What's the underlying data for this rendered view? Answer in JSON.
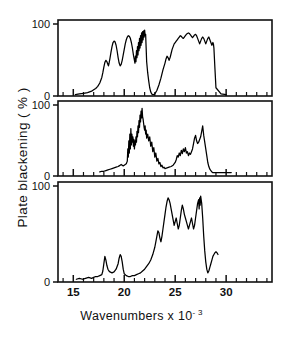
{
  "figure": {
    "top_cutoff_text": "",
    "ylabel": "Plate blackening ( % )",
    "xlabel_main": "Wavenumbers x 10",
    "xlabel_exponent": "- 3",
    "panel_ytick_top": "100",
    "panel_ytick_bottom": "0"
  },
  "chart_data": {
    "type": "line",
    "title": "",
    "xlabel": "Wavenumbers x 10^-3",
    "ylabel": "Plate blackening ( % )",
    "xlim": [
      13.5,
      34.5
    ],
    "ylim": [
      0,
      105
    ],
    "xticks": [
      15,
      20,
      25,
      30
    ],
    "xtick_labels": [
      "15",
      "20",
      "25",
      "30"
    ],
    "xtick_minor_step": 1,
    "yticks": [
      0,
      100
    ],
    "ytick_labels": [
      "0",
      "100"
    ],
    "grid": false,
    "legend": "none",
    "n_panels": 3,
    "panels": [
      {
        "name": "panel-top",
        "index": 0,
        "x": [
          15.2,
          15.6,
          16.0,
          16.4,
          16.8,
          17.0,
          17.2,
          17.4,
          17.6,
          17.8,
          17.9,
          18.0,
          18.1,
          18.2,
          18.3,
          18.4,
          18.45,
          18.5,
          18.6,
          18.7,
          18.8,
          18.9,
          19.0,
          19.1,
          19.2,
          19.3,
          19.4,
          19.5,
          19.6,
          19.7,
          19.8,
          19.9,
          20.0,
          20.1,
          20.2,
          20.3,
          20.4,
          20.5,
          20.6,
          20.7,
          20.8,
          20.9,
          21.0,
          21.05,
          21.1,
          21.15,
          21.2,
          21.25,
          21.3,
          21.35,
          21.4,
          21.45,
          21.5,
          21.55,
          21.6,
          21.65,
          21.7,
          21.75,
          21.8,
          21.85,
          21.9,
          21.95,
          22.0,
          22.05,
          22.1,
          22.15,
          22.2,
          22.3,
          22.4,
          22.5,
          22.6,
          22.7,
          22.8,
          22.9,
          23.0,
          23.2,
          23.4,
          23.6,
          23.8,
          24.0,
          24.1,
          24.2,
          24.3,
          24.4,
          24.5,
          24.6,
          24.7,
          24.8,
          24.9,
          25.0,
          25.1,
          25.2,
          25.3,
          25.4,
          25.5,
          25.6,
          25.7,
          25.8,
          25.9,
          26.0,
          26.1,
          26.2,
          26.3,
          26.4,
          26.5,
          26.6,
          26.7,
          26.8,
          26.9,
          27.0,
          27.1,
          27.2,
          27.3,
          27.4,
          27.5,
          27.6,
          27.7,
          27.8,
          27.9,
          28.0,
          28.1,
          28.2,
          28.3,
          28.4,
          28.5,
          28.6,
          28.7,
          28.75,
          28.8,
          28.9,
          29.0,
          29.5,
          30.0
        ],
        "y": [
          2,
          3,
          4,
          5,
          7,
          9,
          11,
          14,
          19,
          27,
          34,
          42,
          49,
          52,
          50,
          46,
          44,
          47,
          55,
          64,
          72,
          78,
          80,
          79,
          74,
          66,
          56,
          48,
          44,
          46,
          52,
          60,
          68,
          76,
          82,
          86,
          88,
          87,
          84,
          78,
          70,
          60,
          52,
          48,
          58,
          50,
          66,
          56,
          72,
          60,
          78,
          66,
          84,
          70,
          88,
          74,
          92,
          78,
          94,
          82,
          95,
          86,
          96,
          88,
          90,
          70,
          50,
          34,
          22,
          12,
          6,
          3,
          2,
          2,
          3,
          8,
          16,
          26,
          38,
          48,
          54,
          58,
          56,
          52,
          56,
          62,
          68,
          72,
          76,
          78,
          80,
          82,
          84,
          86,
          88,
          87,
          85,
          84,
          86,
          88,
          90,
          91,
          92,
          91,
          89,
          87,
          85,
          87,
          89,
          90,
          88,
          84,
          80,
          76,
          80,
          84,
          86,
          84,
          80,
          76,
          80,
          84,
          86,
          82,
          78,
          74,
          78,
          76,
          70,
          40,
          12,
          3,
          2,
          2,
          2
        ],
        "peak_value": 96
      },
      {
        "name": "panel-middle",
        "index": 1,
        "x": [
          17.6,
          17.8,
          18.0,
          18.2,
          18.4,
          18.6,
          18.8,
          19.0,
          19.2,
          19.4,
          19.5,
          19.6,
          19.7,
          19.8,
          19.9,
          20.0,
          20.1,
          20.2,
          20.3,
          20.35,
          20.4,
          20.45,
          20.5,
          20.55,
          20.6,
          20.65,
          20.7,
          20.75,
          20.8,
          20.85,
          20.9,
          20.95,
          21.0,
          21.05,
          21.1,
          21.15,
          21.2,
          21.25,
          21.3,
          21.35,
          21.4,
          21.45,
          21.5,
          21.55,
          21.6,
          21.65,
          21.7,
          21.75,
          21.8,
          21.85,
          21.9,
          21.95,
          22.0,
          22.05,
          22.1,
          22.15,
          22.2,
          22.3,
          22.4,
          22.5,
          22.6,
          22.7,
          22.8,
          22.9,
          23.0,
          23.1,
          23.2,
          23.3,
          23.4,
          23.5,
          23.6,
          23.7,
          23.8,
          23.9,
          24.0,
          24.2,
          24.4,
          24.6,
          24.8,
          25.0,
          25.1,
          25.2,
          25.3,
          25.4,
          25.5,
          25.6,
          25.7,
          25.8,
          25.9,
          26.0,
          26.1,
          26.2,
          26.3,
          26.4,
          26.5,
          26.6,
          26.7,
          26.8,
          26.9,
          27.0,
          27.1,
          27.2,
          27.3,
          27.4,
          27.5,
          27.6,
          27.7,
          27.8,
          27.9,
          28.0,
          28.1,
          28.2,
          28.3,
          28.4,
          28.5,
          28.6,
          28.7,
          28.8,
          29.0,
          29.2,
          29.5,
          29.8,
          30.0,
          30.3,
          30.5
        ],
        "y": [
          6,
          7,
          7,
          8,
          9,
          10,
          11,
          12,
          13,
          14,
          15,
          16,
          17,
          16,
          15,
          16,
          17,
          18,
          22,
          40,
          28,
          52,
          34,
          62,
          40,
          70,
          46,
          62,
          50,
          58,
          44,
          54,
          40,
          52,
          46,
          58,
          50,
          66,
          58,
          74,
          64,
          82,
          72,
          90,
          80,
          96,
          86,
          100,
          88,
          84,
          78,
          72,
          68,
          74,
          62,
          68,
          56,
          62,
          52,
          58,
          44,
          50,
          36,
          42,
          28,
          34,
          22,
          26,
          18,
          20,
          14,
          16,
          12,
          13,
          11,
          12,
          13,
          14,
          16,
          20,
          24,
          30,
          28,
          34,
          30,
          38,
          33,
          40,
          36,
          42,
          34,
          36,
          30,
          34,
          32,
          36,
          40,
          48,
          56,
          60,
          52,
          48,
          50,
          54,
          58,
          66,
          74,
          60,
          50,
          40,
          30,
          20,
          14,
          10,
          8,
          6,
          5,
          5,
          5,
          5,
          5,
          5,
          5,
          5,
          5
        ],
        "peak_value": 100
      },
      {
        "name": "panel-bottom",
        "index": 2,
        "x": [
          15.3,
          15.6,
          15.9,
          16.2,
          16.5,
          16.8,
          17.0,
          17.2,
          17.4,
          17.6,
          17.8,
          17.9,
          18.0,
          18.1,
          18.2,
          18.3,
          18.4,
          18.5,
          18.6,
          18.8,
          19.0,
          19.2,
          19.4,
          19.5,
          19.6,
          19.7,
          19.8,
          19.9,
          20.0,
          20.2,
          20.4,
          20.6,
          20.8,
          21.0,
          21.2,
          21.4,
          21.6,
          21.8,
          22.0,
          22.2,
          22.4,
          22.6,
          22.8,
          23.0,
          23.1,
          23.2,
          23.3,
          23.4,
          23.5,
          23.6,
          23.7,
          23.8,
          23.9,
          24.0,
          24.1,
          24.2,
          24.3,
          24.4,
          24.5,
          24.6,
          24.7,
          24.8,
          24.9,
          25.0,
          25.1,
          25.2,
          25.3,
          25.4,
          25.5,
          25.6,
          25.7,
          25.8,
          25.9,
          26.0,
          26.1,
          26.2,
          26.3,
          26.4,
          26.5,
          26.6,
          26.7,
          26.8,
          26.9,
          27.0,
          27.1,
          27.2,
          27.3,
          27.35,
          27.4,
          27.45,
          27.5,
          27.6,
          27.7,
          27.8,
          27.9,
          28.0,
          28.1,
          28.2,
          28.3,
          28.4,
          28.5,
          28.6,
          28.7,
          28.8,
          28.9,
          29.0,
          29.1,
          29.2
        ],
        "y": [
          3,
          4,
          3,
          4,
          5,
          4,
          5,
          6,
          6,
          7,
          8,
          12,
          20,
          28,
          24,
          18,
          14,
          12,
          11,
          10,
          11,
          14,
          20,
          26,
          30,
          28,
          22,
          14,
          9,
          7,
          6,
          6,
          7,
          7,
          8,
          9,
          10,
          12,
          14,
          17,
          20,
          24,
          30,
          38,
          44,
          50,
          56,
          54,
          48,
          44,
          50,
          58,
          66,
          74,
          82,
          88,
          92,
          90,
          86,
          80,
          74,
          68,
          62,
          66,
          70,
          64,
          58,
          62,
          70,
          78,
          84,
          80,
          74,
          70,
          66,
          62,
          58,
          62,
          66,
          70,
          64,
          58,
          62,
          70,
          78,
          86,
          90,
          80,
          92,
          84,
          94,
          86,
          70,
          50,
          34,
          22,
          14,
          10,
          12,
          16,
          20,
          24,
          28,
          30,
          32,
          33,
          32,
          30
        ],
        "peak_value": 94
      }
    ]
  }
}
